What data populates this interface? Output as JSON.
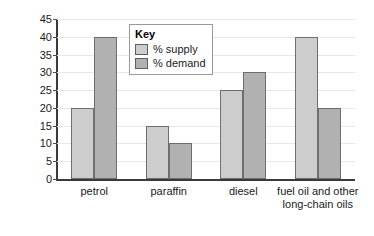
{
  "chart_data": {
    "type": "bar",
    "title": "",
    "xlabel": "",
    "ylabel": "Percentage",
    "ylim": [
      0,
      45
    ],
    "ytick_step": 5,
    "yticks": [
      45,
      40,
      35,
      30,
      25,
      20,
      15,
      10,
      5,
      0
    ],
    "grid": true,
    "legend_position": "top-center-inside",
    "legend_title": "Key",
    "categories": [
      "petrol",
      "paraffin",
      "diesel",
      "fuel oil and other\nlong-chain oils"
    ],
    "series": [
      {
        "name": "% supply",
        "color": "#cdcdcd",
        "values": [
          20,
          15,
          25,
          40
        ]
      },
      {
        "name": "% demand",
        "color": "#b1b1b1",
        "values": [
          40,
          10,
          30,
          20
        ]
      }
    ]
  },
  "colors": {
    "supply": "#cdcdcd",
    "demand": "#b1b1b1",
    "axis": "#3a3a3a",
    "grid": "#e8e8e8",
    "bar_outline": "#6e6e6e",
    "legend_border": "#9a9a9a",
    "background": "#ffffff",
    "text": "#1a1a1a"
  }
}
